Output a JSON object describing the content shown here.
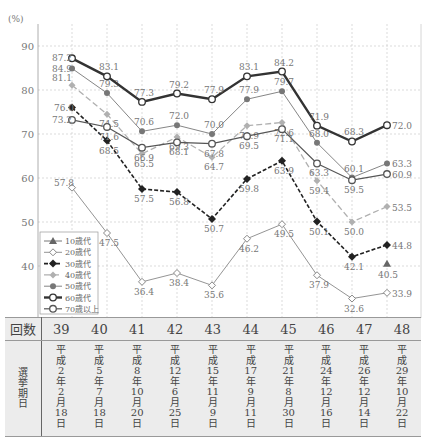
{
  "chart_data": {
    "type": "line",
    "title": "",
    "ylabel": "(%)",
    "xlabel": "回数",
    "ylim": [
      30,
      95
    ],
    "yticks": [
      40,
      50,
      60,
      70,
      80,
      90
    ],
    "grid": true,
    "legend_position": "lower-left",
    "categories": [
      "39",
      "40",
      "41",
      "42",
      "43",
      "44",
      "45",
      "46",
      "47",
      "48"
    ],
    "series": [
      {
        "name": "10歳代",
        "marker": "triangle",
        "style": "solid-thin",
        "color": "#666666",
        "values": [
          null,
          null,
          null,
          null,
          null,
          null,
          null,
          null,
          null,
          40.5
        ]
      },
      {
        "name": "20歳代",
        "marker": "diamond-open",
        "style": "solid-thin",
        "color": "#888888",
        "values": [
          57.8,
          47.5,
          36.4,
          38.4,
          35.6,
          46.2,
          49.5,
          37.9,
          32.6,
          33.9
        ]
      },
      {
        "name": "30歳代",
        "marker": "diamond-filled",
        "style": "dashed-bold",
        "color": "#222222",
        "values": [
          76.0,
          68.5,
          57.5,
          56.8,
          50.7,
          59.8,
          63.9,
          50.1,
          42.1,
          44.8
        ]
      },
      {
        "name": "40歳代",
        "marker": "diamond-light",
        "style": "dashed-light",
        "color": "#b0b0b0",
        "values": [
          81.1,
          74.5,
          65.5,
          69.3,
          64.7,
          71.9,
          72.6,
          59.4,
          50.0,
          53.5
        ]
      },
      {
        "name": "50歳代",
        "marker": "circle-filled",
        "style": "solid-thin",
        "color": "#777777",
        "values": [
          84.9,
          79.3,
          70.6,
          72.0,
          70.0,
          77.9,
          79.7,
          68.0,
          60.1,
          63.3
        ]
      },
      {
        "name": "60歳代",
        "marker": "circle-open",
        "style": "solid-bold",
        "color": "#333333",
        "values": [
          87.2,
          83.1,
          77.3,
          79.2,
          77.9,
          83.1,
          84.2,
          71.9,
          68.3,
          72.0
        ]
      },
      {
        "name": "70歳以上",
        "marker": "circle-open",
        "style": "solid",
        "color": "#555555",
        "values": [
          73.2,
          71.6,
          66.9,
          68.1,
          67.8,
          69.5,
          71.1,
          63.3,
          59.5,
          60.9
        ]
      }
    ]
  },
  "chart": {
    "unit_label": "(%)"
  },
  "table": {
    "row1_header": "回数",
    "row2_header": "選挙期日",
    "sessions": [
      "39",
      "40",
      "41",
      "42",
      "43",
      "44",
      "45",
      "46",
      "47",
      "48"
    ],
    "dates": [
      [
        "平",
        "成",
        "2",
        "年",
        "2",
        "月",
        "18",
        "日"
      ],
      [
        "平",
        "成",
        "5",
        "年",
        "7",
        "月",
        "18",
        "日"
      ],
      [
        "平",
        "成",
        "8",
        "年",
        "10",
        "月",
        "20",
        "日"
      ],
      [
        "平",
        "成",
        "12",
        "年",
        "6",
        "月",
        "25",
        "日"
      ],
      [
        "平",
        "成",
        "15",
        "年",
        "11",
        "月",
        "9",
        "日"
      ],
      [
        "平",
        "成",
        "17",
        "年",
        "9",
        "月",
        "11",
        "日"
      ],
      [
        "平",
        "成",
        "21",
        "年",
        "8",
        "月",
        "30",
        "日"
      ],
      [
        "平",
        "成",
        "24",
        "年",
        "12",
        "月",
        "16",
        "日"
      ],
      [
        "平",
        "成",
        "26",
        "年",
        "12",
        "月",
        "14",
        "日"
      ],
      [
        "平",
        "成",
        "29",
        "年",
        "10",
        "月",
        "22",
        "日"
      ]
    ]
  }
}
